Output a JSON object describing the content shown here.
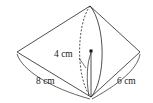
{
  "diagram": {
    "type": "double-cone",
    "labels": {
      "radius": "4 cm",
      "left_slant": "8 cm",
      "right_slant": "6 cm"
    },
    "colors": {
      "stroke": "#222222",
      "background": "#ffffff"
    }
  }
}
